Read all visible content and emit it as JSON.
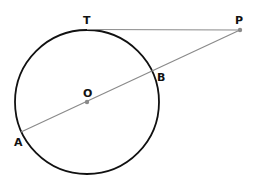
{
  "diagram": {
    "colors": {
      "circle": "#111111",
      "lines": "#8a8a8a",
      "points": "#8a8a8a",
      "labels": "#111111"
    },
    "circle": {
      "cx": 87,
      "cy": 102,
      "r": 72
    },
    "points": {
      "T": {
        "label": "T",
        "x": 87,
        "y": 30
      },
      "P": {
        "label": "P",
        "x": 240,
        "y": 30
      },
      "O": {
        "label": "O",
        "x": 87,
        "y": 102
      },
      "B": {
        "label": "B",
        "x": 153,
        "y": 72
      },
      "A": {
        "label": "A",
        "x": 21,
        "y": 132
      }
    },
    "segments": [
      {
        "name": "tangent-TP",
        "from": "T",
        "to": "P"
      },
      {
        "name": "secant-AP",
        "from": "A",
        "to": "P"
      }
    ]
  }
}
